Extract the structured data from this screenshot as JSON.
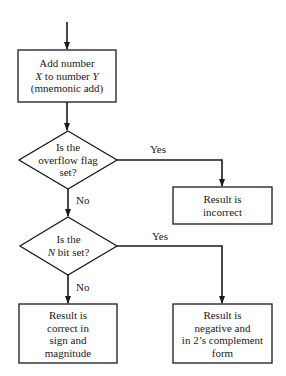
{
  "diagram": {
    "type": "flowchart",
    "colors": {
      "stroke": "#1a1a1a",
      "background": "#ffffff"
    },
    "nodes": [
      {
        "id": "add",
        "shape": "rectangle",
        "lines": [
          "Add number",
          "X to number Y",
          "(mnemonic add)"
        ],
        "line1": "Add number",
        "line2_a": "X",
        "line2_b": " to number ",
        "line2_c": "Y",
        "line3": "(mnemonic add)"
      },
      {
        "id": "overflow_check",
        "shape": "diamond",
        "lines": [
          "Is the",
          "overflow flag",
          "set?"
        ],
        "line1": "Is the",
        "line2": "overflow flag",
        "line3": "set?"
      },
      {
        "id": "incorrect",
        "shape": "rectangle",
        "lines": [
          "Result is",
          "incorrect"
        ],
        "line1": "Result is",
        "line2": "incorrect"
      },
      {
        "id": "n_check",
        "shape": "diamond",
        "lines": [
          "Is the",
          "N bit set?"
        ],
        "line1": "Is the",
        "line2_a": "N",
        "line2_b": " bit set?"
      },
      {
        "id": "correct",
        "shape": "rectangle",
        "lines": [
          "Result is",
          "correct in",
          "sign and",
          "magnitude"
        ],
        "line1": "Result is",
        "line2": "correct in",
        "line3": "sign and",
        "line4": "magnitude"
      },
      {
        "id": "negative",
        "shape": "rectangle",
        "lines": [
          "Result is",
          "negative and",
          "in 2's complement",
          "form"
        ],
        "line1": "Result is",
        "line2": "negative and",
        "line3": "in 2’s complement",
        "line4": "form"
      }
    ],
    "edges": [
      {
        "from": "start",
        "to": "add",
        "label": ""
      },
      {
        "from": "add",
        "to": "overflow_check",
        "label": ""
      },
      {
        "from": "overflow_check",
        "to": "incorrect",
        "label": "Yes"
      },
      {
        "from": "overflow_check",
        "to": "n_check",
        "label": "No"
      },
      {
        "from": "n_check",
        "to": "negative",
        "label": "Yes"
      },
      {
        "from": "n_check",
        "to": "correct",
        "label": "No"
      }
    ],
    "edge_labels": {
      "overflow_yes": "Yes",
      "overflow_no": "No",
      "nbit_yes": "Yes",
      "nbit_no": "No"
    }
  }
}
